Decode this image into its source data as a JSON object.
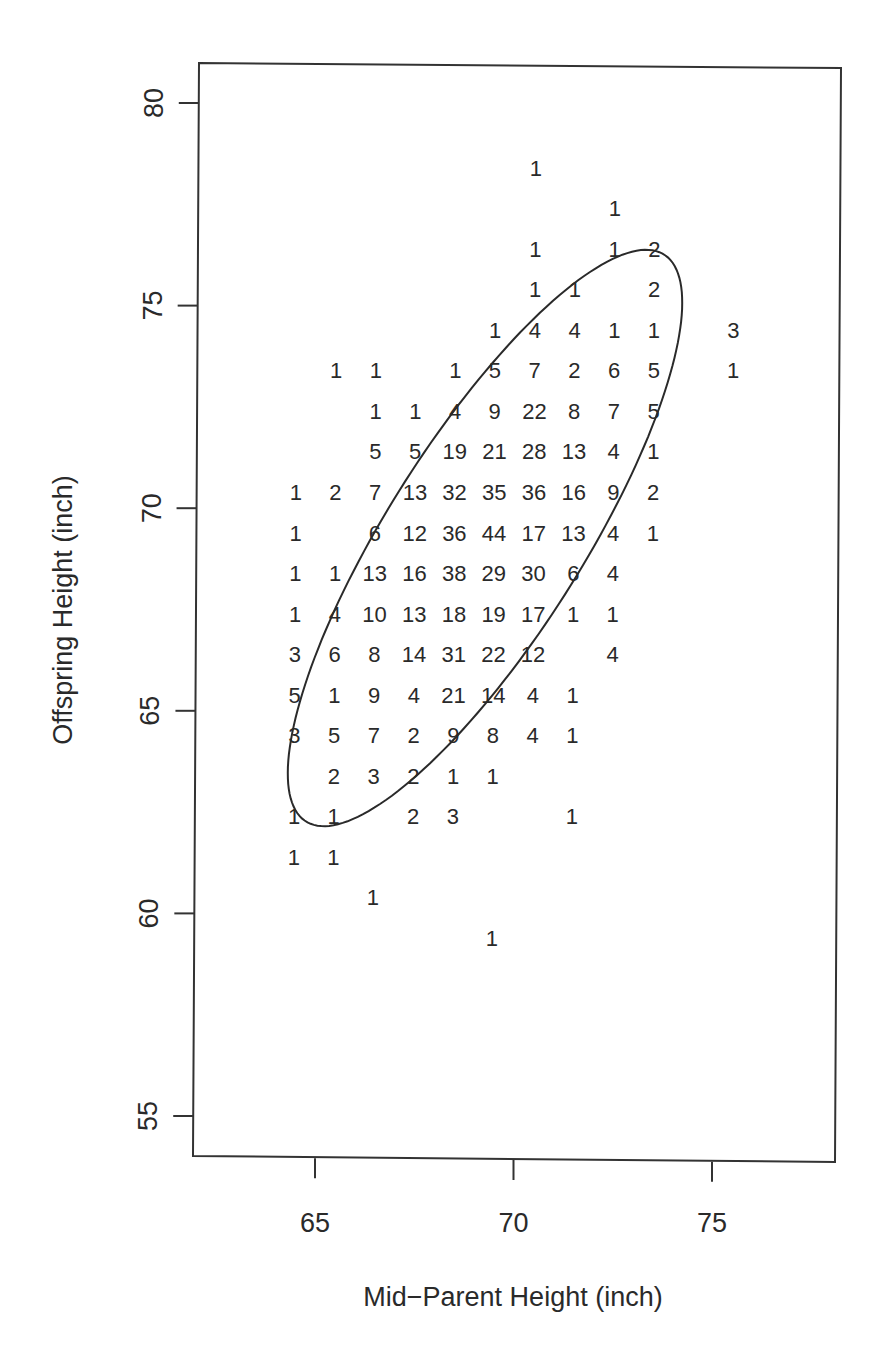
{
  "chart_data": {
    "type": "scatter",
    "subtype": "count-table-scatter",
    "title": "",
    "xlabel": "Mid−Parent Height (inch)",
    "ylabel": "Offspring Height (inch)",
    "xlim": [
      62,
      78.2
    ],
    "ylim": [
      54,
      81
    ],
    "xticks": [
      65,
      70,
      75
    ],
    "yticks": [
      55,
      60,
      65,
      70,
      75,
      80
    ],
    "grid": false,
    "legend": null,
    "x_columns": [
      64.5,
      65.5,
      66.5,
      67.5,
      68.5,
      69.5,
      70.5,
      71.5,
      72.5,
      73.5,
      75.5
    ],
    "rows": [
      {
        "y": 78.4,
        "counts": [
          null,
          null,
          null,
          null,
          null,
          null,
          1,
          null,
          null,
          null,
          null
        ]
      },
      {
        "y": 77.4,
        "counts": [
          null,
          null,
          null,
          null,
          null,
          null,
          null,
          null,
          1,
          null,
          null
        ]
      },
      {
        "y": 76.4,
        "counts": [
          null,
          null,
          null,
          null,
          null,
          null,
          1,
          null,
          1,
          2,
          null
        ]
      },
      {
        "y": 75.4,
        "counts": [
          null,
          null,
          null,
          null,
          null,
          null,
          1,
          1,
          null,
          2,
          null
        ]
      },
      {
        "y": 74.4,
        "counts": [
          null,
          null,
          null,
          null,
          null,
          1,
          4,
          4,
          1,
          1,
          3
        ]
      },
      {
        "y": 73.4,
        "counts": [
          null,
          1,
          1,
          null,
          1,
          5,
          7,
          2,
          6,
          5,
          1
        ]
      },
      {
        "y": 72.4,
        "counts": [
          null,
          null,
          1,
          1,
          4,
          9,
          22,
          8,
          7,
          5,
          null
        ]
      },
      {
        "y": 71.4,
        "counts": [
          null,
          null,
          5,
          5,
          19,
          21,
          28,
          13,
          4,
          1,
          null
        ]
      },
      {
        "y": 70.4,
        "counts": [
          1,
          2,
          7,
          13,
          32,
          35,
          36,
          16,
          9,
          2,
          null
        ]
      },
      {
        "y": 69.4,
        "counts": [
          1,
          null,
          6,
          12,
          36,
          44,
          17,
          13,
          4,
          1,
          null
        ]
      },
      {
        "y": 68.4,
        "counts": [
          1,
          1,
          13,
          16,
          38,
          29,
          30,
          6,
          4,
          null,
          null
        ]
      },
      {
        "y": 67.4,
        "counts": [
          1,
          4,
          10,
          13,
          18,
          19,
          17,
          1,
          1,
          null,
          null
        ]
      },
      {
        "y": 66.4,
        "counts": [
          3,
          6,
          8,
          14,
          31,
          22,
          12,
          null,
          4,
          null,
          null
        ]
      },
      {
        "y": 65.4,
        "counts": [
          5,
          1,
          9,
          4,
          21,
          14,
          4,
          1,
          null,
          null,
          null
        ]
      },
      {
        "y": 64.4,
        "counts": [
          3,
          5,
          7,
          2,
          9,
          8,
          4,
          1,
          null,
          null,
          null
        ]
      },
      {
        "y": 63.4,
        "counts": [
          null,
          2,
          3,
          2,
          1,
          1,
          null,
          null,
          null,
          null,
          null
        ]
      },
      {
        "y": 62.4,
        "counts": [
          1,
          1,
          null,
          2,
          3,
          null,
          null,
          1,
          null,
          null,
          null
        ]
      },
      {
        "y": 61.4,
        "counts": [
          1,
          1,
          null,
          null,
          null,
          null,
          null,
          null,
          null,
          null,
          null
        ]
      },
      {
        "y": 60.4,
        "counts": [
          null,
          null,
          1,
          null,
          null,
          null,
          null,
          null,
          null,
          null,
          null
        ]
      },
      {
        "y": 59.4,
        "counts": [
          null,
          null,
          null,
          null,
          null,
          1,
          null,
          null,
          null,
          null,
          null
        ]
      }
    ],
    "annotations": [
      {
        "type": "ellipse",
        "description": "concentration ellipse tilted along positive correlation",
        "center": [
          68.6,
          68.5
        ],
        "top": [
          71.5,
          75.5
        ],
        "right": [
          73.6,
          71.9
        ],
        "bottom": [
          67.1,
          62.9
        ],
        "left": [
          64.9,
          65.9
        ]
      }
    ]
  },
  "axes": {
    "x_tick_labels": [
      "65",
      "70",
      "75"
    ],
    "y_tick_labels": [
      "55",
      "60",
      "65",
      "70",
      "75",
      "80"
    ]
  }
}
